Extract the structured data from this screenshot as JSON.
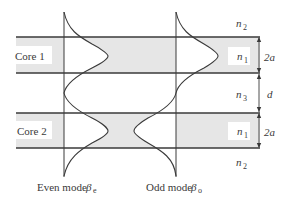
{
  "diagram": {
    "type": "coupled-waveguide-modes",
    "colors": {
      "core_fill": "#e6e6e6",
      "line": "#3a3a3a",
      "label_bg": "#ffffff"
    },
    "cores": [
      {
        "label": "Core 1",
        "index_label": "n",
        "index_sub": "1",
        "thickness_label": "2a"
      },
      {
        "label": "Core 2",
        "index_label": "n",
        "index_sub": "1",
        "thickness_label": "2a"
      }
    ],
    "cladding": {
      "top": {
        "label": "n",
        "sub": "2"
      },
      "between": {
        "label": "n",
        "sub": "3",
        "gap_label": "d"
      },
      "bottom": {
        "label": "n",
        "sub": "2"
      }
    },
    "modes": [
      {
        "name": "Even mode",
        "symbol": "β",
        "sub": "e"
      },
      {
        "name": "Odd mode",
        "symbol": "β",
        "sub": "o"
      }
    ]
  }
}
